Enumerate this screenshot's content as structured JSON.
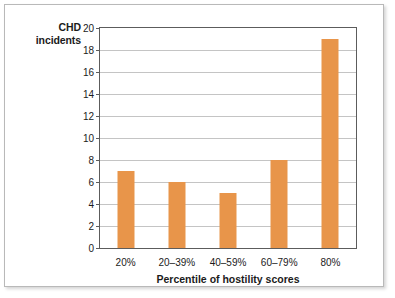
{
  "chart_data": {
    "type": "bar",
    "title": "",
    "xlabel": "Percentile of hostility scores",
    "ylabel": "CHD incidents",
    "categories": [
      "20%",
      "20–39%",
      "40–59%",
      "60–79%",
      "80%"
    ],
    "values": [
      7,
      6,
      5,
      8,
      19
    ],
    "ylim": [
      0,
      20
    ],
    "yticks": [
      0,
      2,
      4,
      6,
      8,
      10,
      12,
      14,
      16,
      18,
      20
    ],
    "ytick_labels": [
      "0",
      "2",
      "4",
      "6",
      "8",
      "10",
      "12",
      "14",
      "16",
      "18",
      "20"
    ],
    "grid": true,
    "legend": null,
    "bar_color": "#e8954a",
    "gridline_color": "#c4c4c4",
    "axis_color": "#5c5c5c",
    "plot_background": "#ffffff"
  },
  "ylabel_lines": {
    "line1": "CHD",
    "line2": "incidents"
  }
}
